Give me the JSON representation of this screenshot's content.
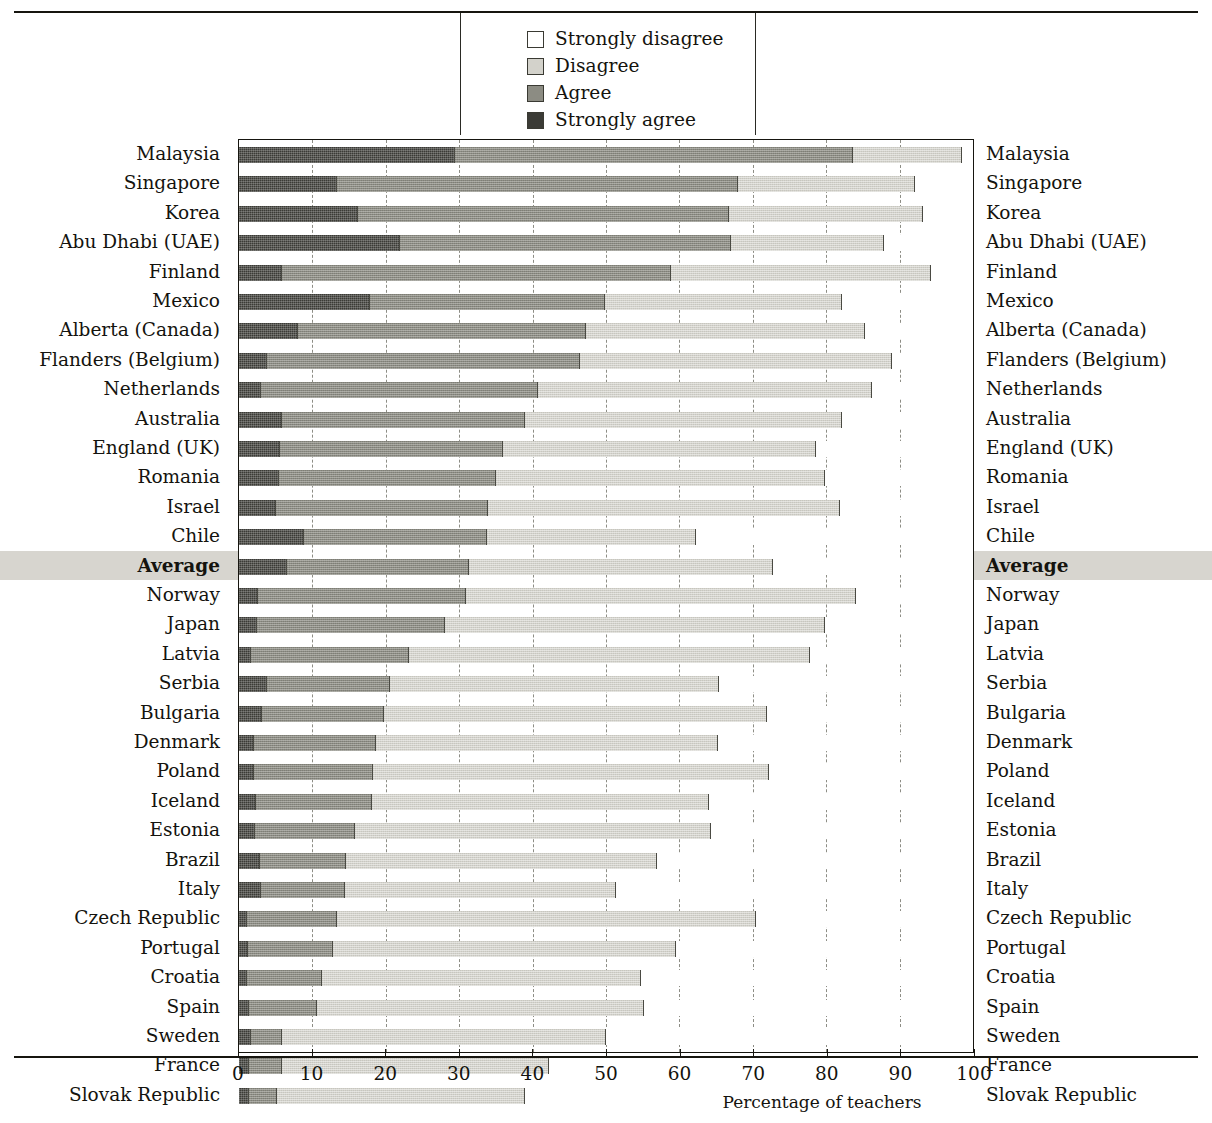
{
  "legend": {
    "items": [
      {
        "label": "Strongly disagree",
        "key": "sdisagree",
        "swatch": "#ffffff"
      },
      {
        "label": "Disagree",
        "key": "disagree",
        "swatch": "#d3d2cb"
      },
      {
        "label": "Agree",
        "key": "agree",
        "swatch": "#8c8c83"
      },
      {
        "label": "Strongly agree",
        "key": "sagree",
        "swatch": "#3b3b36"
      }
    ]
  },
  "axis": {
    "title": "Percentage of teachers",
    "ticks": [
      0,
      10,
      20,
      30,
      40,
      50,
      60,
      70,
      80,
      90,
      100
    ],
    "min": 0,
    "max": 100,
    "gridlines": [
      10,
      20,
      30,
      40,
      50,
      60,
      70,
      80,
      90
    ]
  },
  "chart_data": {
    "type": "bar",
    "title": "Percentage of teachers",
    "xlabel": "Percentage of teachers",
    "ylabel": "",
    "xlim": [
      0,
      100
    ],
    "grid": true,
    "orientation": "horizontal",
    "stacked": true,
    "legend_position": "top",
    "series_order": [
      "Strongly agree",
      "Agree",
      "Disagree",
      "Strongly disagree"
    ],
    "categories": [
      "Malaysia",
      "Singapore",
      "Korea",
      "Abu Dhabi (UAE)",
      "Finland",
      "Mexico",
      "Alberta (Canada)",
      "Flanders (Belgium)",
      "Netherlands",
      "Australia",
      "England (UK)",
      "Romania",
      "Israel",
      "Chile",
      "Average",
      "Norway",
      "Japan",
      "Latvia",
      "Serbia",
      "Bulgaria",
      "Denmark",
      "Poland",
      "Iceland",
      "Estonia",
      "Brazil",
      "Italy",
      "Czech Republic",
      "Portugal",
      "Croatia",
      "Spain",
      "Sweden",
      "France",
      "Slovak Republic"
    ],
    "series": [
      {
        "name": "Strongly agree",
        "values": [
          29.4,
          13.4,
          16.2,
          22.0,
          5.8,
          17.8,
          8.0,
          3.8,
          3.0,
          5.9,
          5.6,
          5.4,
          5.1,
          8.9,
          6.5,
          2.6,
          2.4,
          1.6,
          3.8,
          3.2,
          2.1,
          2.1,
          2.3,
          2.2,
          2.8,
          3.0,
          1.1,
          1.2,
          1.1,
          1.4,
          1.6,
          1.3,
          1.3
        ]
      },
      {
        "name": "Agree",
        "values": [
          54.3,
          54.6,
          50.6,
          45.0,
          53.1,
          32.0,
          39.3,
          42.6,
          37.7,
          33.0,
          30.4,
          29.6,
          28.8,
          24.9,
          24.9,
          28.3,
          25.6,
          21.6,
          16.8,
          16.6,
          16.6,
          16.1,
          15.8,
          13.6,
          11.8,
          11.5,
          12.2,
          11.6,
          10.2,
          9.2,
          4.2,
          4.5,
          3.9
        ]
      },
      {
        "name": "Disagree",
        "values": [
          14.8,
          24.1,
          26.4,
          20.9,
          35.4,
          32.4,
          38.0,
          42.5,
          45.5,
          43.3,
          42.6,
          44.8,
          48.0,
          28.5,
          41.3,
          53.1,
          51.8,
          54.6,
          44.8,
          52.2,
          46.5,
          54.0,
          46.0,
          48.5,
          42.4,
          36.8,
          57.2,
          46.7,
          43.5,
          44.6,
          44.2,
          36.4,
          33.8
        ]
      },
      {
        "name": "Strongly disagree",
        "values": [
          1.5,
          7.9,
          6.8,
          12.1,
          5.7,
          17.8,
          14.7,
          11.1,
          13.8,
          17.8,
          21.4,
          20.2,
          18.1,
          37.7,
          27.3,
          16.0,
          20.2,
          22.2,
          34.6,
          28.0,
          34.8,
          27.8,
          35.9,
          35.7,
          43.0,
          48.7,
          29.5,
          40.5,
          45.2,
          44.8,
          50.0,
          57.8,
          61.0
        ]
      }
    ]
  }
}
